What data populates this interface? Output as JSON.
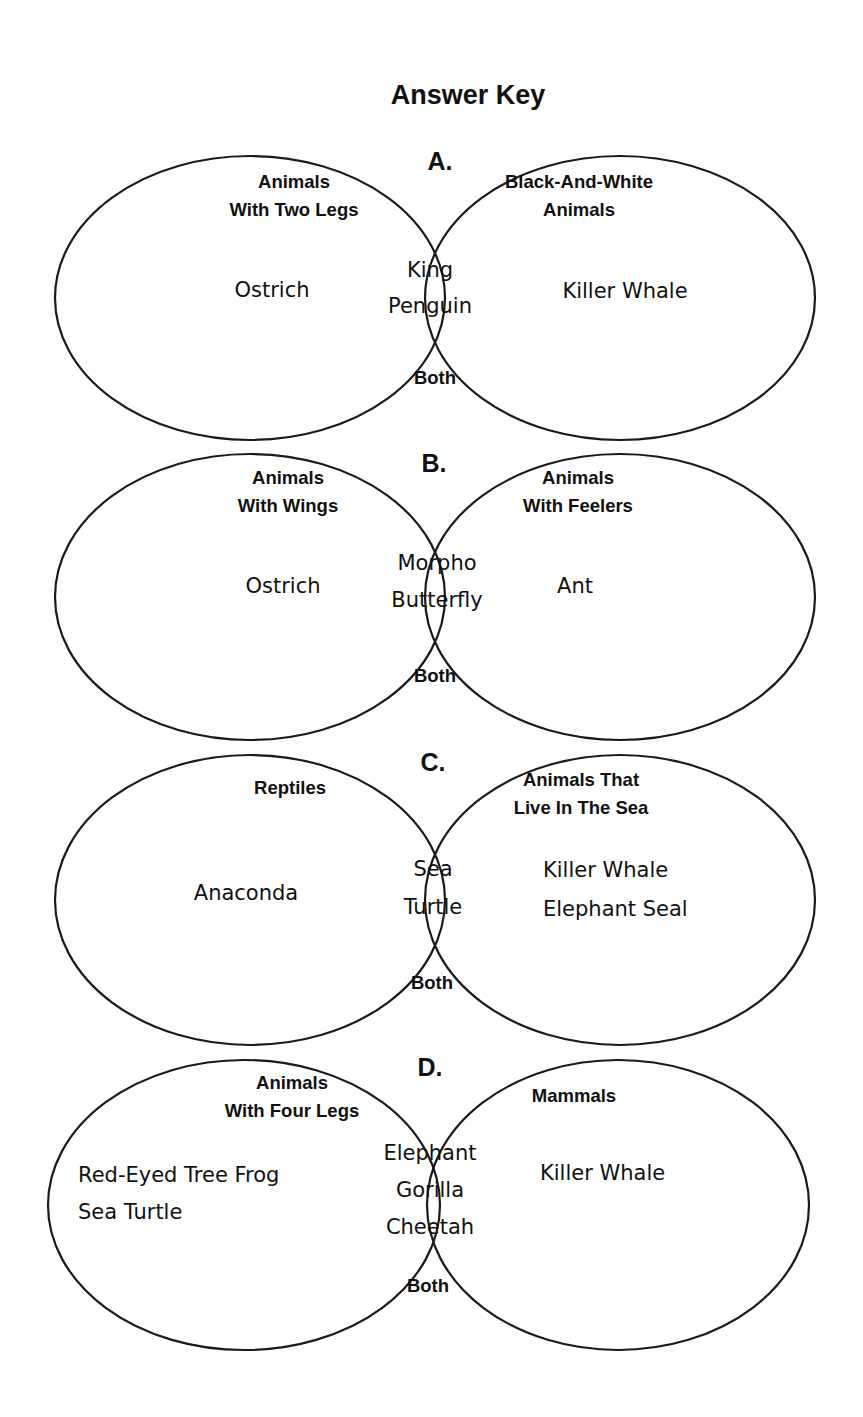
{
  "title": "Answer Key",
  "diagrams": [
    {
      "letter": "A.",
      "left_heading": [
        "Animals",
        "With Two Legs"
      ],
      "right_heading": [
        "Black-And-White",
        "Animals"
      ],
      "left_items": [
        "Ostrich"
      ],
      "center_items": [
        "King",
        "Penguin"
      ],
      "right_items": [
        "Killer Whale"
      ],
      "both_label": "Both"
    },
    {
      "letter": "B.",
      "left_heading": [
        "Animals",
        "With Wings"
      ],
      "right_heading": [
        "Animals",
        "With Feelers"
      ],
      "left_items": [
        "Ostrich"
      ],
      "center_items": [
        "Morpho",
        "Butterfly"
      ],
      "right_items": [
        "Ant"
      ],
      "both_label": "Both"
    },
    {
      "letter": "C.",
      "left_heading": [
        "Reptiles"
      ],
      "right_heading": [
        "Animals That",
        "Live In The Sea"
      ],
      "left_items": [
        "Anaconda"
      ],
      "center_items": [
        "Sea",
        "Turtle"
      ],
      "right_items": [
        "Killer Whale",
        "Elephant Seal"
      ],
      "both_label": "Both"
    },
    {
      "letter": "D.",
      "left_heading": [
        "Animals",
        "With Four Legs"
      ],
      "right_heading": [
        "Mammals"
      ],
      "left_items": [
        "Red-Eyed Tree Frog",
        "Sea Turtle"
      ],
      "center_items": [
        "Elephant",
        "Gorilla",
        "Cheetah"
      ],
      "right_items": [
        "Killer Whale"
      ],
      "both_label": "Both"
    }
  ],
  "colors": {
    "background": "#ffffff",
    "ink": "#111111"
  }
}
